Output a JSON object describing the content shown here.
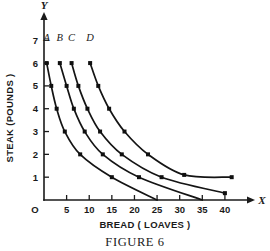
{
  "figure": {
    "caption": "FIGURE 6",
    "background_color": "#ffffff",
    "ink_color": "#141414"
  },
  "chart_data": {
    "type": "line",
    "title": "",
    "subtitle": "",
    "xlabel": "BREAD ( LOAVES )",
    "ylabel": "STEAK (POUNDS )",
    "x_axis_letter": "X",
    "y_axis_letter": "Y",
    "origin_label": "O",
    "xlim": [
      0,
      44
    ],
    "ylim": [
      0,
      7.8
    ],
    "xticks": [
      5,
      10,
      15,
      20,
      25,
      30,
      35,
      40
    ],
    "xtick_labels": [
      "5",
      "10",
      "15",
      "20",
      "25",
      "30",
      "35",
      "40"
    ],
    "yticks": [
      1,
      2,
      3,
      4,
      5,
      6,
      7
    ],
    "ytick_labels": [
      "1",
      "2",
      "3",
      "4",
      "5",
      "6",
      "7"
    ],
    "grid": false,
    "legend_position": "inline-curve-labels",
    "markers": "filled-square",
    "series": [
      {
        "name": "A",
        "label": "A",
        "label_x": 0.6,
        "label_y": 6.95,
        "points": [
          {
            "x": 0.6,
            "y": 6.0
          },
          {
            "x": 1.6,
            "y": 5.0
          },
          {
            "x": 2.8,
            "y": 4.0
          },
          {
            "x": 4.6,
            "y": 3.0
          },
          {
            "x": 8.0,
            "y": 2.0
          },
          {
            "x": 15.0,
            "y": 1.0
          },
          {
            "x": 25.0,
            "y": 0.0
          }
        ]
      },
      {
        "name": "B",
        "label": "B",
        "label_x": 3.5,
        "label_y": 6.95,
        "points": [
          {
            "x": 3.5,
            "y": 6.0
          },
          {
            "x": 5.0,
            "y": 5.0
          },
          {
            "x": 6.6,
            "y": 4.0
          },
          {
            "x": 9.0,
            "y": 3.0
          },
          {
            "x": 13.0,
            "y": 2.0
          },
          {
            "x": 21.0,
            "y": 1.0
          },
          {
            "x": 35.0,
            "y": 0.0
          }
        ]
      },
      {
        "name": "C",
        "label": "C",
        "label_x": 6.1,
        "label_y": 6.95,
        "points": [
          {
            "x": 6.1,
            "y": 6.0
          },
          {
            "x": 7.6,
            "y": 5.0
          },
          {
            "x": 9.6,
            "y": 4.0
          },
          {
            "x": 12.4,
            "y": 3.0
          },
          {
            "x": 17.2,
            "y": 2.0
          },
          {
            "x": 26.0,
            "y": 1.0
          },
          {
            "x": 40.0,
            "y": 0.3
          }
        ]
      },
      {
        "name": "D",
        "label": "D",
        "label_x": 10.2,
        "label_y": 6.95,
        "points": [
          {
            "x": 10.2,
            "y": 6.0
          },
          {
            "x": 12.0,
            "y": 5.0
          },
          {
            "x": 14.4,
            "y": 4.0
          },
          {
            "x": 17.8,
            "y": 3.0
          },
          {
            "x": 23.0,
            "y": 2.0
          },
          {
            "x": 31.0,
            "y": 1.1
          },
          {
            "x": 41.5,
            "y": 1.0
          }
        ]
      }
    ]
  }
}
